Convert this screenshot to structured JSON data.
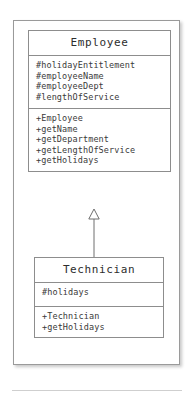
{
  "diagram": {
    "type": "uml-class-diagram",
    "title": "",
    "colors": {
      "background": "#ffffff",
      "frame_border": "#9a9a9a",
      "box_border": "#8d8d8d",
      "text": "#3a3a3a",
      "title_text": "#2d2d2d",
      "connector": "#6f6f6f",
      "rule": "#cfcfcf"
    },
    "classes": [
      {
        "name": "Employee",
        "attributes": [
          "#holidayEntitlement",
          "#employeeName",
          "#employeeDept",
          "#lengthOfService"
        ],
        "operations": [
          "+Employee",
          "+getName",
          "+getDepartment",
          "+getLengthOfService",
          "+getHolidays"
        ]
      },
      {
        "name": "Technician",
        "attributes": [
          "#holidays"
        ],
        "operations": [
          "+Technician",
          "+getHolidays"
        ]
      }
    ],
    "relationships": [
      {
        "kind": "generalization",
        "source": "Technician",
        "target": "Employee",
        "arrowhead": "hollow-triangle"
      }
    ]
  }
}
